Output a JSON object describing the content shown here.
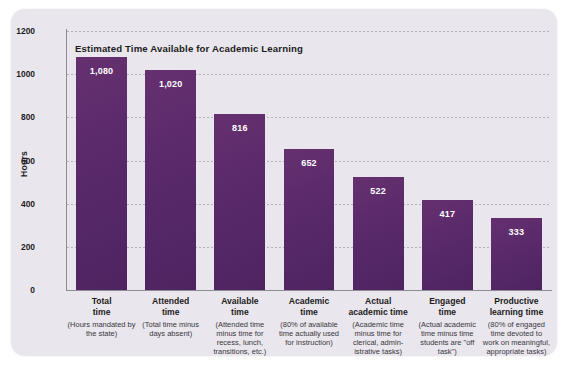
{
  "chart_data": {
    "type": "bar",
    "title": "Estimated Time Available for Academic Learning",
    "xlabel": "",
    "ylabel": "Hours",
    "ylim": [
      0,
      1200
    ],
    "yticks": [
      "0",
      "200",
      "400",
      "600",
      "800",
      "1000",
      "1200"
    ],
    "ytick_values": [
      0,
      200,
      400,
      600,
      800,
      1000,
      1200
    ],
    "grid": "horizontal-dotted",
    "legend": "none",
    "bar_color": "#5c2a6d",
    "value_label_color": "#ffffff",
    "categories": [
      "Total time",
      "Attended time",
      "Available time",
      "Academic time",
      "Actual academic time",
      "Engaged time",
      "Productive learning time"
    ],
    "values": [
      1080,
      1020,
      816,
      652,
      522,
      417,
      333
    ],
    "value_labels": [
      "1,080",
      "1,020",
      "816",
      "652",
      "522",
      "417",
      "333"
    ],
    "bars": [
      {
        "name_line1": "Total",
        "name_line2": "time",
        "description": "(Hours mandated by the state)",
        "value": 1080,
        "label": "1,080"
      },
      {
        "name_line1": "Attended",
        "name_line2": "time",
        "description": "(Total time minus days absent)",
        "value": 1020,
        "label": "1,020"
      },
      {
        "name_line1": "Available",
        "name_line2": "time",
        "description": "(Attended time minus time for recess, lunch, transitions, etc.)",
        "value": 816,
        "label": "816"
      },
      {
        "name_line1": "Academic",
        "name_line2": "time",
        "description": "(80% of available time actually used for instruction)",
        "value": 652,
        "label": "652"
      },
      {
        "name_line1": "Actual",
        "name_line2": "academic time",
        "description": "(Academic time minus time for clerical, admin-istrative tasks)",
        "value": 522,
        "label": "522"
      },
      {
        "name_line1": "Engaged",
        "name_line2": "time",
        "description": "(Actual academic time minus time students are \"off task\")",
        "value": 417,
        "label": "417"
      },
      {
        "name_line1": "Productive",
        "name_line2": "learning time",
        "description": "(80% of engaged time devoted to work on meaningful, appropriate tasks)",
        "value": 333,
        "label": "333"
      }
    ]
  }
}
